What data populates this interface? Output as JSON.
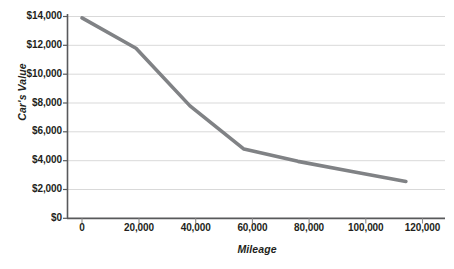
{
  "chart_data": {
    "type": "line",
    "title": "",
    "subtitle": "",
    "xlabel": "Mileage",
    "ylabel": "Car's Value",
    "x": [
      0,
      20000,
      40000,
      60000,
      80000,
      100000,
      120000
    ],
    "values": [
      13900,
      11800,
      7800,
      4800,
      3950,
      3250,
      2550
    ],
    "series": [
      {
        "name": "Car's Value",
        "values": [
          13900,
          11800,
          7800,
          4800,
          3950,
          3250,
          2550
        ]
      }
    ],
    "xlim": [
      0,
      128000
    ],
    "ylim": [
      0,
      14000
    ],
    "x_tick_labels": [
      "0",
      "20,000",
      "40,000",
      "60,000",
      "80,000",
      "100,000",
      "120,000"
    ],
    "x_tick_values": [
      0,
      20000,
      40000,
      60000,
      80000,
      100000,
      120000
    ],
    "y_tick_labels": [
      "$0",
      "$2,000",
      "$4,000",
      "$6,000",
      "$8,000",
      "$10,000",
      "$12,000",
      "$14,000"
    ],
    "y_tick_values": [
      0,
      2000,
      4000,
      6000,
      8000,
      10000,
      12000,
      14000
    ],
    "grid": true,
    "grid_axis": "y",
    "legend": false,
    "legend_position": "none",
    "annotations": [],
    "colors": {
      "line": "#808285",
      "grid": "#d9d9d9",
      "axis": "#58595b",
      "text": "#231f20",
      "background": "#ffffff"
    }
  },
  "axes": {
    "y_title": "Car's Value",
    "x_title": "Mileage",
    "y_ticks": [
      {
        "label": "$14,000"
      },
      {
        "label": "$12,000"
      },
      {
        "label": "$10,000"
      },
      {
        "label": "$8,000"
      },
      {
        "label": "$6,000"
      },
      {
        "label": "$4,000"
      },
      {
        "label": "$2,000"
      },
      {
        "label": "$0"
      }
    ],
    "x_ticks": [
      {
        "label": "0"
      },
      {
        "label": "20,000"
      },
      {
        "label": "40,000"
      },
      {
        "label": "60,000"
      },
      {
        "label": "80,000"
      },
      {
        "label": "100,000"
      },
      {
        "label": "120,000"
      }
    ]
  }
}
